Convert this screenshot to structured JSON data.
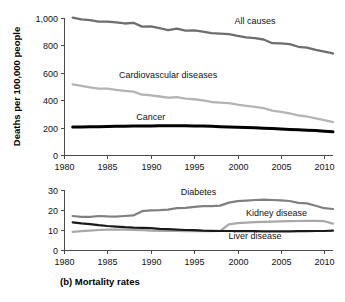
{
  "figure": {
    "caption": "(b) Mortality rates",
    "background": "#ffffff"
  },
  "chart_data": [
    {
      "id": "top",
      "type": "line",
      "title": "",
      "xlabel": "",
      "ylabel": "Deaths per 100,000 people",
      "xlim": [
        1980,
        2011
      ],
      "ylim": [
        0,
        1000
      ],
      "xticks": [
        1980,
        1985,
        1990,
        1995,
        2000,
        2005,
        2010
      ],
      "xticklabels": [
        "1980",
        "1985",
        "1990",
        "1995",
        "2000",
        "2005",
        "2010"
      ],
      "yticks": [
        0,
        200,
        400,
        600,
        800,
        1000
      ],
      "yticklabels": [
        "0",
        "200",
        "400",
        "600",
        "800",
        "1,000"
      ],
      "grid": false,
      "legend_position": "inline-annotations",
      "x": [
        1981,
        1982,
        1983,
        1984,
        1985,
        1986,
        1987,
        1988,
        1989,
        1990,
        1991,
        1992,
        1993,
        1994,
        1995,
        1996,
        1997,
        1998,
        1999,
        2000,
        2001,
        2002,
        2003,
        2004,
        2005,
        2006,
        2007,
        2008,
        2009,
        2010,
        2011
      ],
      "series": [
        {
          "name": "All causes",
          "color": "#6e6e6e",
          "width": 2.3,
          "label_x": 2002,
          "label_y": 955,
          "values": [
            1003,
            990,
            985,
            973,
            974,
            968,
            960,
            965,
            937,
            938,
            926,
            912,
            923,
            908,
            909,
            900,
            889,
            886,
            882,
            869,
            858,
            853,
            843,
            816,
            815,
            810,
            790,
            783,
            767,
            755,
            741
          ]
        },
        {
          "name": "Cardiovascular diseases",
          "color": "#b4b4b4",
          "width": 2.3,
          "label_x": 1992,
          "label_y": 560,
          "values": [
            516,
            504,
            494,
            485,
            485,
            476,
            468,
            463,
            440,
            436,
            427,
            418,
            422,
            412,
            407,
            398,
            387,
            382,
            379,
            368,
            359,
            351,
            342,
            324,
            315,
            303,
            290,
            281,
            267,
            254,
            240
          ]
        },
        {
          "name": "Cancer",
          "color": "#000000",
          "width": 3.0,
          "label_x": 1990,
          "label_y": 258,
          "values": [
            205,
            205,
            206,
            207,
            208,
            209,
            210,
            211,
            211,
            212,
            213,
            213,
            213,
            213,
            212,
            211,
            209,
            207,
            205,
            203,
            201,
            199,
            196,
            193,
            190,
            187,
            184,
            181,
            178,
            174,
            169
          ]
        }
      ]
    },
    {
      "id": "bottom",
      "type": "line",
      "title": "",
      "xlabel": "",
      "ylabel": "",
      "xlim": [
        1980,
        2011
      ],
      "ylim": [
        0,
        30
      ],
      "xticks": [
        1980,
        1985,
        1990,
        1995,
        2000,
        2005,
        2010
      ],
      "xticklabels": [
        "1980",
        "1985",
        "1990",
        "1995",
        "2000",
        "2005",
        "2010"
      ],
      "yticks": [
        0,
        10,
        20,
        30
      ],
      "yticklabels": [
        "0",
        "10",
        "20",
        "30"
      ],
      "grid": false,
      "legend_position": "inline-annotations",
      "x": [
        1981,
        1982,
        1983,
        1984,
        1985,
        1986,
        1987,
        1988,
        1989,
        1990,
        1991,
        1992,
        1993,
        1994,
        1995,
        1996,
        1997,
        1998,
        1999,
        2000,
        2001,
        2002,
        2003,
        2004,
        2005,
        2006,
        2007,
        2008,
        2009,
        2010,
        2011
      ],
      "series": [
        {
          "name": "Diabetes",
          "color": "#808080",
          "width": 2.2,
          "label_x": 1995.5,
          "label_y": 27.5,
          "values": [
            17.0,
            16.6,
            16.6,
            17.0,
            16.8,
            16.7,
            17.0,
            17.3,
            19.4,
            19.8,
            19.9,
            20.2,
            20.9,
            21.1,
            21.6,
            21.9,
            21.9,
            22.2,
            23.7,
            24.4,
            24.7,
            25.0,
            25.2,
            25.0,
            24.8,
            24.5,
            23.6,
            23.3,
            22.1,
            20.9,
            20.5
          ]
        },
        {
          "name": "Kidney disease",
          "color": "#a8a8a8",
          "width": 2.2,
          "label_x": 2004.5,
          "label_y": 17.2,
          "values": [
            9.1,
            9.4,
            9.7,
            10.0,
            10.2,
            10.2,
            10.2,
            10.1,
            9.9,
            9.7,
            9.6,
            9.5,
            9.5,
            9.4,
            9.4,
            9.4,
            9.4,
            9.5,
            12.8,
            13.4,
            13.7,
            13.9,
            14.1,
            14.2,
            14.3,
            14.4,
            14.5,
            14.6,
            14.6,
            14.4,
            13.2
          ]
        },
        {
          "name": "Liver disease",
          "color": "#1a1a1a",
          "width": 2.2,
          "label_x": 2002,
          "label_y": 5.6,
          "values": [
            13.8,
            13.3,
            12.9,
            12.4,
            12.0,
            11.7,
            11.4,
            11.2,
            11.1,
            10.9,
            10.6,
            10.4,
            10.2,
            10.0,
            9.9,
            9.7,
            9.6,
            9.5,
            9.5,
            9.4,
            9.4,
            9.4,
            9.3,
            9.3,
            9.3,
            9.3,
            9.4,
            9.4,
            9.5,
            9.5,
            9.7
          ]
        }
      ]
    }
  ]
}
